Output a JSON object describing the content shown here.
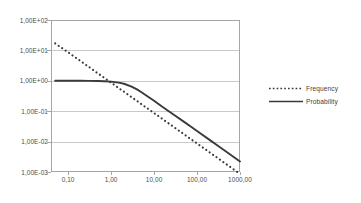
{
  "chart_data": {
    "type": "line",
    "title": "",
    "xlabel": "",
    "ylabel": "",
    "xscale": "log",
    "yscale": "log",
    "xlim": [
      0.04,
      1000
    ],
    "ylim": [
      0.001,
      100
    ],
    "grid": "horizontal",
    "legend_position": "right",
    "x_tick_labels": [
      "0,01",
      "0,10",
      "1,00",
      "10,00",
      "100,00",
      "1000,00"
    ],
    "x_tick_values": [
      0.01,
      0.1,
      1,
      10,
      100,
      1000
    ],
    "y_tick_labels": [
      "1,00E+02",
      "1,00E+01",
      "1,00E+00",
      "1,00E-01",
      "1,00E-02",
      "1,00E-03"
    ],
    "y_tick_values": [
      100,
      10,
      1,
      0.1,
      0.01,
      0.001
    ],
    "series": [
      {
        "name": "Frequency",
        "style": "dotted",
        "color": "#3a3a3a",
        "x": [
          0.05,
          0.07,
          0.1,
          0.15,
          0.2,
          0.3,
          0.5,
          0.7,
          1,
          1.5,
          2,
          3,
          5,
          7,
          10,
          15,
          20,
          30,
          50,
          70,
          100,
          150,
          200,
          300,
          500,
          700,
          1000
        ],
        "y": [
          17,
          12.3,
          8.7,
          5.8,
          4.35,
          2.9,
          1.74,
          1.24,
          0.87,
          0.58,
          0.435,
          0.29,
          0.174,
          0.124,
          0.087,
          0.058,
          0.0435,
          0.029,
          0.0174,
          0.0124,
          0.0087,
          0.0058,
          0.00435,
          0.0029,
          0.00174,
          0.00124,
          0.00087
        ]
      },
      {
        "name": "Probability",
        "style": "solid",
        "color": "#3a3a3a",
        "x": [
          0.05,
          0.1,
          0.2,
          0.3,
          0.5,
          0.7,
          1,
          1.5,
          2,
          3,
          4,
          5,
          7,
          10,
          15,
          20,
          30,
          50,
          70,
          100,
          200,
          300,
          500,
          700,
          1000
        ],
        "y": [
          1.0,
          1.0,
          1.0,
          0.995,
          0.985,
          0.97,
          0.94,
          0.87,
          0.8,
          0.64,
          0.52,
          0.43,
          0.31,
          0.22,
          0.145,
          0.11,
          0.074,
          0.0445,
          0.0318,
          0.0223,
          0.0112,
          0.00745,
          0.00447,
          0.00319,
          0.00223
        ]
      }
    ],
    "legend": [
      {
        "label": "Frequency",
        "style": "dotted"
      },
      {
        "label": "Probability",
        "style": "solid"
      }
    ]
  },
  "colors": {
    "series": "#3a3a3a",
    "gridline": "#c9c9c9",
    "axis": "#a6a6a6",
    "text": "#4a4a4a",
    "background": "#ffffff"
  }
}
